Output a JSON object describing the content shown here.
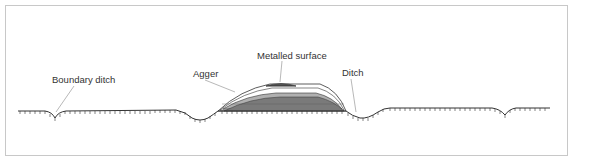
{
  "figure": {
    "labels": {
      "boundary_ditch": "Boundary ditch",
      "agger": "Agger",
      "metalled_surface": "Metalled surface",
      "ditch": "Ditch"
    },
    "colors": {
      "frame": "#c8c8c8",
      "line": "#333333",
      "leader": "#999999",
      "fill_dark": "#7a7a7a",
      "fill_mid": "#b0b0b0"
    }
  }
}
